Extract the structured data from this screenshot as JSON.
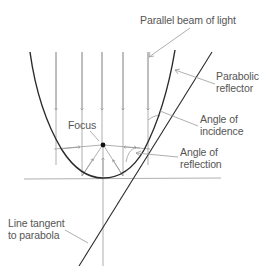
{
  "diagram": {
    "labels": {
      "beam": "Parallel beam of light",
      "reflector_line1": "Parabolic",
      "reflector_line2": "reflector",
      "incidence_line1": "Angle of",
      "incidence_line2": "incidence",
      "focus": "Focus",
      "reflection_line1": "Angle of",
      "reflection_line2": "reflection",
      "tangent_line1": "Line tangent",
      "tangent_line2": "to parabola"
    },
    "colors": {
      "curve": "#2a2a2a",
      "rays": "#9a9a9a",
      "text": "#555555",
      "background": "#ffffff"
    },
    "elements": [
      "parabolic-reflector-curve",
      "incident-light-rays",
      "reflected-light-rays",
      "focus-point",
      "tangent-line",
      "axis-lines"
    ]
  }
}
